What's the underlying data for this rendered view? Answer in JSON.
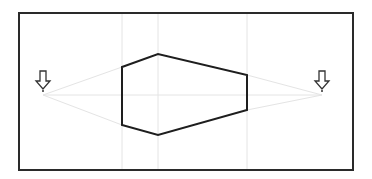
{
  "diagram": {
    "type": "two-point-perspective",
    "colors": {
      "background": "#ffffff",
      "frame": "#2a2a2a",
      "shape": "#1e1e1e",
      "guides": "#e4e4e4",
      "arrow": "#333333"
    },
    "frame": {
      "x": 19,
      "y": 13,
      "width": 334,
      "height": 157
    },
    "horizon_y": 95,
    "vanishing_points": [
      {
        "id": "left",
        "x": 43,
        "y": 95,
        "marker": "down-arrow-icon"
      },
      {
        "id": "right",
        "x": 322,
        "y": 95,
        "marker": "down-arrow-icon"
      }
    ],
    "vertical_guides": [
      122,
      158,
      247
    ],
    "shape_points": [
      [
        122,
        67
      ],
      [
        158,
        54
      ],
      [
        247,
        75
      ],
      [
        247,
        110
      ],
      [
        158,
        135
      ],
      [
        122,
        125
      ]
    ]
  }
}
